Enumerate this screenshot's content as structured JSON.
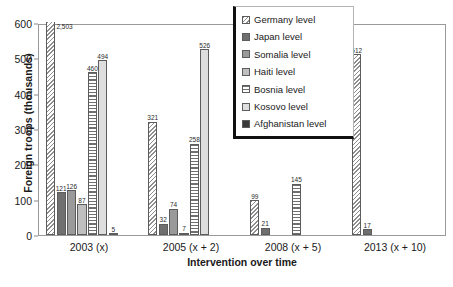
{
  "chart_data": {
    "type": "bar",
    "title": "",
    "xlabel": "Intervention over time",
    "ylabel": "Foreign troops (thousands)",
    "categories": [
      "2003 (x)",
      "2005 (x + 2)",
      "2008 (x + 5)",
      "2013 (x + 10)"
    ],
    "ylim": [
      0,
      600
    ],
    "yticks": [
      0,
      100,
      200,
      300,
      400,
      500,
      600
    ],
    "grid": false,
    "legend_position": "top-center-right",
    "note": "Germany bar in 2003 (x) is clipped at the 600 axis maximum; its data label reads 2,503",
    "series": [
      {
        "name": "Germany level",
        "pattern": "diagonal-hatch",
        "color": "#8e8e8e",
        "values": [
          2503,
          321,
          99,
          512
        ],
        "labels": [
          "2,503",
          "321",
          "99",
          "512"
        ],
        "clipped": [
          true,
          false,
          false,
          false
        ]
      },
      {
        "name": "Japan level",
        "pattern": "solid-dark-gray",
        "color": "#6f6f6f",
        "values": [
          121,
          32,
          21,
          17
        ],
        "labels": [
          "121",
          "32",
          "21",
          "17"
        ]
      },
      {
        "name": "Somalia level",
        "pattern": "solid-medium-gray",
        "color": "#9a9a9a",
        "values": [
          126,
          74,
          null,
          null
        ],
        "labels": [
          "126",
          "74",
          "",
          ""
        ]
      },
      {
        "name": "Haiti level",
        "pattern": "solid-light-gray",
        "color": "#bfbfbf",
        "values": [
          87,
          7,
          null,
          null
        ],
        "labels": [
          "87",
          "7",
          "",
          ""
        ]
      },
      {
        "name": "Bosnia level",
        "pattern": "horizontal-stripes",
        "color": "#6f6f6f",
        "values": [
          460,
          258,
          145,
          null
        ],
        "labels": [
          "460",
          "258",
          "145",
          ""
        ]
      },
      {
        "name": "Kosovo level",
        "pattern": "solid-very-light-gray",
        "color": "#dedede",
        "values": [
          494,
          526,
          null,
          null
        ],
        "labels": [
          "494",
          "526",
          "",
          ""
        ]
      },
      {
        "name": "Afghanistan level",
        "pattern": "solid-near-black",
        "color": "#3a3a3a",
        "values": [
          5,
          null,
          null,
          null
        ],
        "labels": [
          "5",
          "",
          "",
          ""
        ]
      }
    ]
  },
  "legend": {
    "items": [
      {
        "label": "Germany level",
        "swatch": "p-germany"
      },
      {
        "label": "Japan level",
        "swatch": "p-japan"
      },
      {
        "label": "Somalia level",
        "swatch": "p-somalia"
      },
      {
        "label": "Haiti level",
        "swatch": "p-haiti"
      },
      {
        "label": "Bosnia level",
        "swatch": "p-bosnia"
      },
      {
        "label": "Kosovo level",
        "swatch": "p-kosovo"
      },
      {
        "label": "Afghanistan level",
        "swatch": "p-afghan"
      }
    ]
  }
}
